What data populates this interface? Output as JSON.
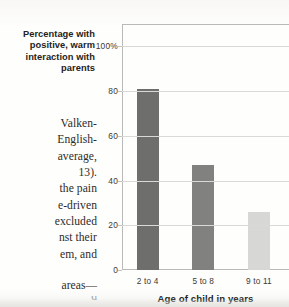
{
  "page": {
    "clipped_top_line": "and to",
    "body_lines": [
      "Valken-",
      "English-",
      "average,",
      "13).",
      "the pain",
      "e-driven",
      "excluded",
      "nst their",
      "em, and"
    ],
    "body_tail_line": "areas—",
    "clipped_bottom_line": "d"
  },
  "chart_data": {
    "type": "bar",
    "title": "",
    "ylabel": "Percentage with positive, warm interaction with parents",
    "xlabel": "Age of child in years",
    "categories": [
      "2 to 4",
      "5 to 8",
      "9 to 11"
    ],
    "values": [
      81,
      47,
      26
    ],
    "ylim": [
      0,
      110
    ],
    "yticks": [
      0,
      20,
      40,
      60,
      80,
      100
    ],
    "ytick_labels": [
      "0",
      "20",
      "40",
      "60",
      "80",
      "100%"
    ],
    "grid": "horizontal",
    "legend": "none",
    "bar_colors": [
      "#6e6e6d",
      "#818180",
      "#d7d7d5"
    ],
    "axis_color": "#b9b9b7",
    "grid_color": "#d9d9d7"
  }
}
